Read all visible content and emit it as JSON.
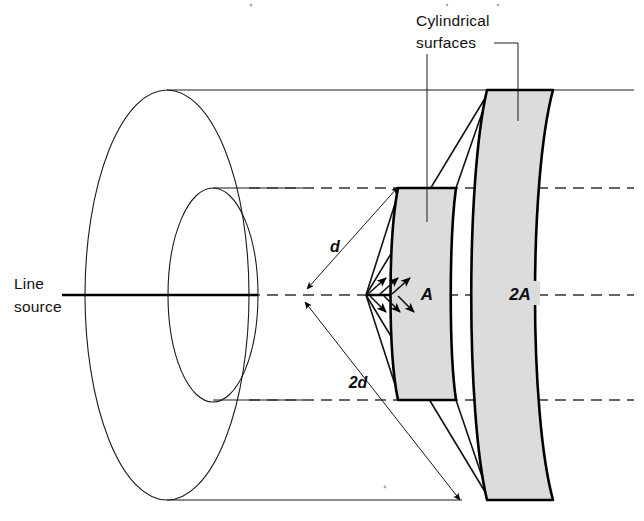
{
  "figure": {
    "title_visible": false,
    "background_color": "#ffffff",
    "ink_color": "#111111",
    "shade_color": "#dcdcdc",
    "labels": {
      "cylindrical_surfaces_line1": "Cylindrical",
      "cylindrical_surfaces_line2": "surfaces",
      "line_source_line1": "Line",
      "line_source_line2": "source",
      "distance_near": "d",
      "distance_far": "2d",
      "area_near": "A",
      "area_far": "2A"
    },
    "annotations": {
      "near_band_name": "A",
      "far_band_name": "2A",
      "near_radius_name": "d",
      "far_radius_name": "2d",
      "source_name": "Line source",
      "surfaces_name": "Cylindrical surfaces"
    },
    "geometry": {
      "apex_x": 366,
      "apex_y": 295,
      "axis_y": 295,
      "near_band_inner_x": 398,
      "near_band_outer_x": 456,
      "far_band_inner_x": 487,
      "far_band_outer_x": 553,
      "cylinder_top_y": 90,
      "cylinder_bottom_y": 500,
      "dash_upper_y": 188,
      "dash_lower_y": 400
    },
    "counts": {
      "ray_arrows_upper": 3,
      "ray_arrows_lower": 3,
      "dimension_arrows": 2,
      "leader_lines": 2,
      "shaded_bands": 2,
      "concentric_ellipses": 2
    }
  }
}
